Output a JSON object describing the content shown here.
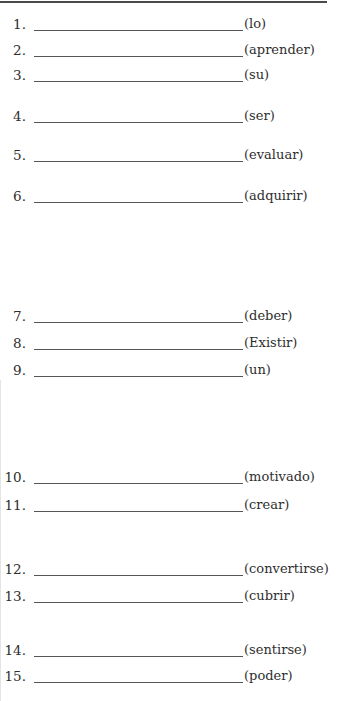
{
  "worksheet": {
    "items": [
      {
        "number": "1.",
        "hint": "(lo)",
        "answer": "",
        "y": 32
      },
      {
        "number": "2.",
        "hint": "(aprender)",
        "answer": "",
        "y": 58
      },
      {
        "number": "3.",
        "hint": "(su)",
        "answer": "",
        "y": 83
      },
      {
        "number": "4.",
        "hint": "(ser)",
        "answer": "",
        "y": 124
      },
      {
        "number": "5.",
        "hint": "(evaluar)",
        "answer": "",
        "y": 163
      },
      {
        "number": "6.",
        "hint": "(adquirir)",
        "answer": "",
        "y": 204
      },
      {
        "number": "7.",
        "hint": "(deber)",
        "answer": "",
        "y": 324
      },
      {
        "number": "8.",
        "hint": "(Existir)",
        "answer": "",
        "y": 351
      },
      {
        "number": "9.",
        "hint": "(un)",
        "answer": "",
        "y": 378
      },
      {
        "number": "10.",
        "hint": "(motivado)",
        "answer": "",
        "y": 485
      },
      {
        "number": "11.",
        "hint": "(crear)",
        "answer": "",
        "y": 513
      },
      {
        "number": "12.",
        "hint": "(convertirse)",
        "answer": "",
        "y": 577
      },
      {
        "number": "13.",
        "hint": "(cubrir)",
        "answer": "",
        "y": 604
      },
      {
        "number": "14.",
        "hint": "(sentirse)",
        "answer": "",
        "y": 658
      },
      {
        "number": "15.",
        "hint": "(poder)",
        "answer": "",
        "y": 684
      }
    ]
  },
  "colors": {
    "text": "#2e2e2e",
    "rule": "#4a4a4a",
    "blank_line": "#555555"
  }
}
